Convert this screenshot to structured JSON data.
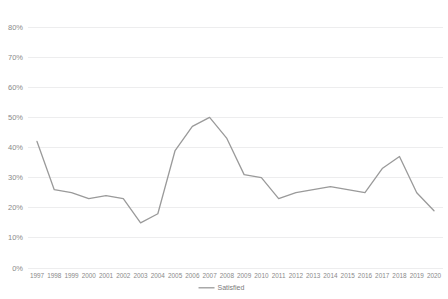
{
  "chart_data": {
    "type": "line",
    "title": "",
    "xlabel": "",
    "ylabel": "",
    "ylim": [
      0,
      80
    ],
    "ytick_labels": [
      "0%",
      "10%",
      "20%",
      "30%",
      "40%",
      "50%",
      "60%",
      "70%",
      "80%"
    ],
    "ytick_values": [
      0,
      10,
      20,
      30,
      40,
      50,
      60,
      70,
      80
    ],
    "grid": true,
    "legend_position": "bottom",
    "line_color": "#9a9a9a",
    "categories": [
      "1997",
      "1998",
      "1999",
      "2000",
      "2001",
      "2002",
      "2003",
      "2004",
      "2005",
      "2006",
      "2007",
      "2008",
      "2009",
      "2010",
      "2011",
      "2012",
      "2013",
      "2014",
      "2015",
      "2016",
      "2017",
      "2018",
      "2019",
      "2020"
    ],
    "series": [
      {
        "name": "Satisfied",
        "values": [
          42,
          26,
          25,
          23,
          24,
          23,
          15,
          18,
          39,
          47,
          50,
          43,
          31,
          30,
          23,
          25,
          26,
          27,
          26,
          25,
          33,
          37,
          25,
          19
        ]
      }
    ]
  },
  "legend": {
    "items": [
      {
        "label": "Satisfied"
      }
    ]
  }
}
